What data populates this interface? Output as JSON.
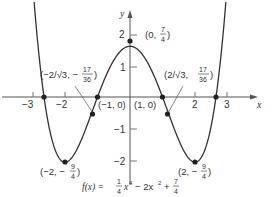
{
  "chart_data": {
    "type": "line",
    "title": "",
    "function_label": "f(x) = (1/4)x^4 - 2x^2 + 7/4",
    "formula_parts": {
      "lhs": "f(x) =",
      "t1_num": "1",
      "t1_den": "4",
      "t1_var": "x",
      "t1_exp": "4",
      "t2": "− 2x",
      "t2_exp": "2",
      "plus": "+",
      "t3_num": "7",
      "t3_den": "4"
    },
    "xlabel": "x",
    "ylabel": "y",
    "xlim": [
      -3.2,
      3.5
    ],
    "ylim": [
      -2.3,
      2.5
    ],
    "x_ticks": [
      {
        "value": -3,
        "label": "−3"
      },
      {
        "value": -2,
        "label": "−2"
      },
      {
        "value": 2,
        "label": "2"
      },
      {
        "value": 3,
        "label": "3"
      }
    ],
    "y_ticks": [
      {
        "value": 2,
        "label": "2"
      },
      {
        "value": 1,
        "label": "1"
      },
      {
        "value": -1,
        "label": "−1"
      },
      {
        "value": -2,
        "label": "−2"
      }
    ],
    "grid": false,
    "series": [
      {
        "name": "f(x)",
        "x": [
          -2.95,
          -2.5,
          -2.0,
          -1.5,
          -1.0,
          -0.5,
          0,
          0.5,
          1.0,
          1.5,
          2.0,
          2.5,
          2.95
        ],
        "values": [
          1.97,
          -0.99,
          -2.25,
          -1.484,
          0,
          1.266,
          1.75,
          1.266,
          0,
          -1.484,
          -2.25,
          -0.99,
          1.97
        ]
      }
    ],
    "points": [
      {
        "name": "max",
        "x": 0,
        "y": 1.75,
        "label": "(0, 7/4)"
      },
      {
        "name": "min-left",
        "x": -2,
        "y": -2.25,
        "label": "(−2, −9/4)"
      },
      {
        "name": "min-right",
        "x": 2,
        "y": -2.25,
        "label": "(2, −9/4)"
      },
      {
        "name": "root-neg1",
        "x": -1,
        "y": 0,
        "label": "(−1, 0)"
      },
      {
        "name": "root-pos1",
        "x": 1,
        "y": 0,
        "label": "(1, 0)"
      },
      {
        "name": "root-neg-outer",
        "x": -2.6458,
        "y": 0,
        "label": ""
      },
      {
        "name": "root-pos-outer",
        "x": 2.6458,
        "y": 0,
        "label": ""
      },
      {
        "name": "inflection-left",
        "x": -1.1547,
        "y": -0.4722,
        "label": "(−2/√3, −17/36)"
      },
      {
        "name": "inflection-right",
        "x": 1.1547,
        "y": -0.4722,
        "label": "(2/√3, −17/36)"
      }
    ],
    "labels": {
      "max": {
        "open": "(0,",
        "num": "7",
        "den": "4",
        "close": ")"
      },
      "root_neg1": "(−1, 0)",
      "root_pos1": "(1, 0)",
      "min_left": {
        "open": "(−2, −",
        "num": "9",
        "den": "4",
        "close": ")"
      },
      "min_right": {
        "open": "(2, −",
        "num": "9",
        "den": "4",
        "close": ")"
      },
      "infl_left": {
        "open": "(−2/√3, −",
        "num": "17",
        "den": "36",
        "close": ")"
      },
      "infl_right": {
        "open": "(2/√3, ",
        "num": "17",
        "den": "36",
        "close": ")"
      }
    },
    "colors": {
      "curve": "#333333",
      "axis": "#555555",
      "point": "#222222"
    }
  }
}
